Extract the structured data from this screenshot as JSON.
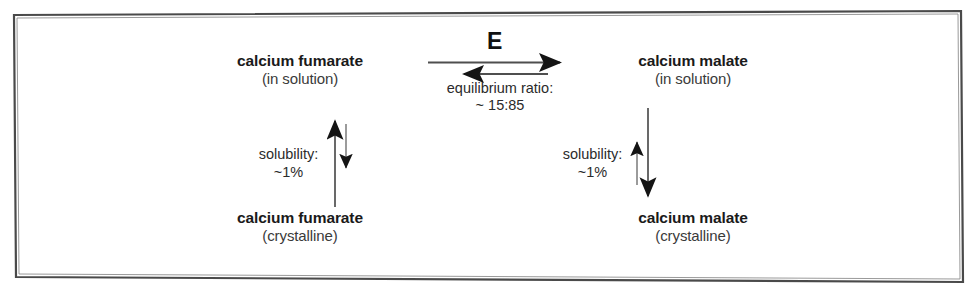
{
  "figure": {
    "type": "reaction-equilibrium-diagram",
    "border_color": "#3a3a3a",
    "text_color": "#1a1a1a",
    "background": "#ffffff"
  },
  "nodes": {
    "fumarate_solution": {
      "title": "calcium fumarate",
      "subtitle": "(in solution)"
    },
    "malate_solution": {
      "title": "calcium malate",
      "subtitle": "(in solution)"
    },
    "fumarate_crystalline": {
      "title": "calcium fumarate",
      "subtitle": "(crystalline)"
    },
    "malate_crystalline": {
      "title": "calcium malate",
      "subtitle": "(crystalline)"
    }
  },
  "edges": {
    "horizontal": {
      "catalyst": "E",
      "caption": "equilibrium ratio:",
      "ratio": "~ 15:85",
      "forward_direction": "right",
      "reverse_direction": "left"
    },
    "solubility_left": {
      "caption": "solubility:",
      "value": "~1%",
      "dominant_direction": "up"
    },
    "solubility_right": {
      "caption": "solubility:",
      "value": "~1%",
      "dominant_direction": "down"
    }
  }
}
